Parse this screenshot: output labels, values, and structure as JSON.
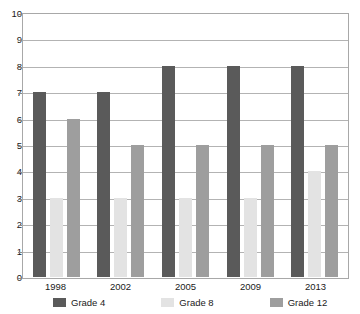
{
  "chart_data": {
    "type": "bar",
    "title": "",
    "subtitle": "",
    "xlabel": "",
    "ylabel": "",
    "categories": [
      "1998",
      "2002",
      "2005",
      "2009",
      "2013"
    ],
    "series": [
      {
        "name": "Grade 4",
        "color": "#5a5a5a",
        "values": [
          7,
          7,
          8,
          8,
          8
        ]
      },
      {
        "name": "Grade 8",
        "color": "#e3e3e3",
        "values": [
          3,
          3,
          3,
          3,
          4
        ]
      },
      {
        "name": "Grade 12",
        "color": "#9e9e9e",
        "values": [
          6,
          5,
          5,
          5,
          5
        ]
      }
    ],
    "ylim": [
      0,
      10
    ],
    "ytick_step": 1,
    "yticks": [
      "0",
      "1",
      "2",
      "3",
      "4",
      "5",
      "6",
      "7",
      "8",
      "9",
      "10"
    ],
    "grid": "horizontal",
    "legend_position": "bottom",
    "bar_layout": "grouped"
  },
  "legend": {
    "items": [
      {
        "label": "Grade 4",
        "color": "#5a5a5a"
      },
      {
        "label": "Grade 8",
        "color": "#e3e3e3"
      },
      {
        "label": "Grade 12",
        "color": "#9e9e9e"
      }
    ]
  },
  "style": {
    "plot_border_color": "#a8a8a8",
    "gridline_color": "#b3b3b3",
    "axis_color": "#8a8a8a",
    "background": "#ffffff",
    "text_color": "#1a1a1a"
  }
}
